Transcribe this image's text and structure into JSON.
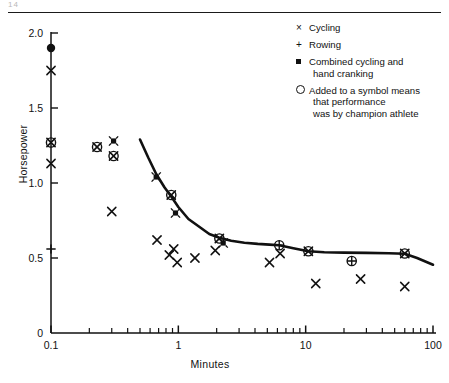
{
  "page": {
    "header_ghost": "14",
    "has_header_rule": true
  },
  "chart_data": {
    "type": "scatter",
    "title": "",
    "xlabel": "Minutes",
    "ylabel": "Horsepower",
    "xscale": "log",
    "yscale": "linear",
    "xlim": [
      0.1,
      100
    ],
    "ylim": [
      0,
      2.05
    ],
    "xticks": [
      0.1,
      1,
      10,
      100
    ],
    "xticklabels": [
      "0.1",
      "1",
      "10",
      "100"
    ],
    "yticks": [
      0,
      0.5,
      1.0,
      1.5,
      2.0
    ],
    "yticklabels": [
      "0",
      "0.5",
      "1.0",
      "1.5",
      "2.0"
    ],
    "grid": false,
    "legend_position": "upper right",
    "legend": [
      {
        "symbol": "x",
        "label": "Cycling"
      },
      {
        "symbol": "+",
        "label": "Rowing"
      },
      {
        "symbol": "filled-square",
        "label": "Combined cycling and",
        "label2": "hand cranking"
      },
      {
        "symbol": "open-circle",
        "label": "Added to a symbol means",
        "label2": "that performance",
        "label3": "was by champion athlete"
      }
    ],
    "series": [
      {
        "name": "Cycling",
        "symbol": "x",
        "points": [
          [
            0.1,
            1.75
          ],
          [
            0.1,
            1.13
          ],
          [
            0.3,
            0.81
          ],
          [
            0.68,
            0.62
          ],
          [
            0.85,
            0.52
          ],
          [
            0.92,
            0.56
          ],
          [
            0.98,
            0.47
          ],
          [
            1.35,
            0.5
          ],
          [
            1.95,
            0.55
          ],
          [
            5.2,
            0.47
          ],
          [
            6.3,
            0.53
          ],
          [
            12.0,
            0.33
          ],
          [
            27.0,
            0.36
          ],
          [
            60.0,
            0.31
          ]
        ]
      },
      {
        "name": "Rowing",
        "symbol": "+",
        "points": [
          [
            0.1,
            0.56
          ]
        ]
      },
      {
        "name": "Combined cycling and hand cranking",
        "symbol": "filled-square",
        "points": [
          [
            0.31,
            1.28
          ],
          [
            0.67,
            1.04
          ],
          [
            0.95,
            0.8
          ],
          [
            2.25,
            0.6
          ]
        ]
      },
      {
        "name": "Cycling (champion)",
        "symbol": "circled-x",
        "points": [
          [
            0.1,
            1.27
          ],
          [
            0.23,
            1.24
          ],
          [
            0.31,
            1.18
          ],
          [
            0.88,
            0.92
          ],
          [
            2.1,
            0.63
          ],
          [
            10.5,
            0.545
          ],
          [
            60.0,
            0.53
          ]
        ]
      },
      {
        "name": "Rowing (champion)",
        "symbol": "circled-plus",
        "points": [
          [
            6.2,
            0.585
          ],
          [
            23.0,
            0.48
          ]
        ]
      },
      {
        "name": "Combined (champion)",
        "symbol": "filled-circle",
        "points": [
          [
            0.1,
            1.9
          ]
        ]
      }
    ],
    "fitted_curve": {
      "name": "Maximum human power output envelope",
      "points": [
        [
          0.5,
          1.29
        ],
        [
          0.58,
          1.17
        ],
        [
          0.67,
          1.06
        ],
        [
          0.78,
          0.97
        ],
        [
          0.88,
          0.91
        ],
        [
          1.0,
          0.84
        ],
        [
          1.2,
          0.76
        ],
        [
          1.45,
          0.71
        ],
        [
          1.75,
          0.66
        ],
        [
          2.1,
          0.635
        ],
        [
          2.6,
          0.615
        ],
        [
          3.3,
          0.602
        ],
        [
          4.2,
          0.594
        ],
        [
          5.2,
          0.589
        ],
        [
          6.2,
          0.585
        ],
        [
          8.0,
          0.565
        ],
        [
          10.5,
          0.545
        ],
        [
          14.0,
          0.538
        ],
        [
          20.0,
          0.536
        ],
        [
          30.0,
          0.534
        ],
        [
          45.0,
          0.532
        ],
        [
          60.0,
          0.528
        ],
        [
          75.0,
          0.5
        ],
        [
          100.0,
          0.455
        ]
      ]
    }
  }
}
